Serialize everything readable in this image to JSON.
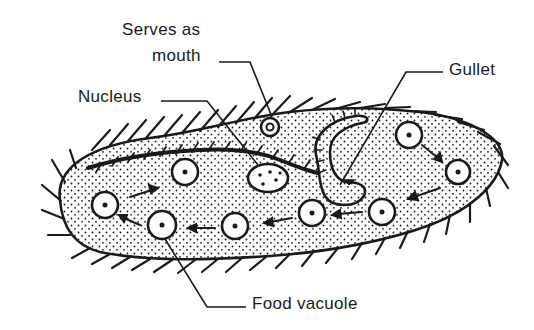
{
  "diagram": {
    "labels": {
      "mouth_line1": "Serves as",
      "mouth_line2": "mouth",
      "nucleus": "Nucleus",
      "gullet": "Gullet",
      "food_vacuole": "Food vacuole"
    },
    "colors": {
      "ink": "#1a1a1a",
      "background": "#ffffff"
    },
    "food_vacuoles": [
      {
        "cx": 185,
        "cy": 172
      },
      {
        "cx": 105,
        "cy": 205
      },
      {
        "cx": 162,
        "cy": 225
      },
      {
        "cx": 235,
        "cy": 226
      },
      {
        "cx": 312,
        "cy": 213
      },
      {
        "cx": 382,
        "cy": 212
      },
      {
        "cx": 409,
        "cy": 135
      },
      {
        "cx": 458,
        "cy": 172
      }
    ]
  }
}
